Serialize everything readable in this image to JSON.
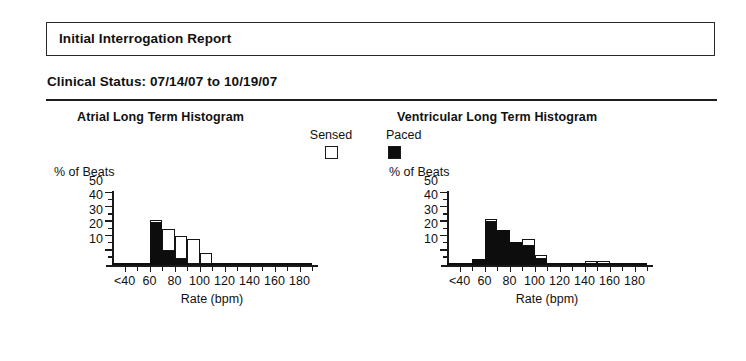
{
  "report": {
    "title": "Initial Interrogation Report",
    "clinical_status": "Clinical Status: 07/14/07 to 10/19/07"
  },
  "legend": {
    "sensed_label": "Sensed",
    "sensed_swatch": "open-square",
    "paced_label": "Paced",
    "paced_swatch": "filled-square"
  },
  "panels": {
    "atrial": {
      "title": "Atrial Long Term Histogram"
    },
    "ventricular": {
      "title": "Ventricular Long Term Histogram"
    }
  },
  "axes": {
    "ylabel": "% of Beats",
    "xlabel": "Rate (bpm)",
    "yticks": [
      "10",
      "20",
      "30",
      "40",
      "50"
    ],
    "xticks": [
      "<40",
      "60",
      "80",
      "100",
      "120",
      "140",
      "160",
      "180"
    ]
  },
  "colors": {
    "ink": "#141414",
    "paced": "#0d0d0d",
    "sensed": "#ffffff",
    "paper": "#ffffff"
  },
  "chart_data": [
    {
      "type": "bar",
      "id": "atrial-long-term-histogram",
      "title": "Atrial Long Term Histogram",
      "xlabel": "Rate (bpm)",
      "ylabel": "% of Beats",
      "ylim": [
        0,
        50
      ],
      "yticks": [
        10,
        20,
        30,
        40,
        50
      ],
      "xtick_labels": [
        "<40",
        "60",
        "80",
        "100",
        "120",
        "140",
        "160",
        "180"
      ],
      "xtick_values": [
        40,
        60,
        80,
        100,
        120,
        140,
        160,
        180
      ],
      "bin_width": 10,
      "grid": false,
      "legend_position": "top-center",
      "stacked": true,
      "categories": [
        "<40",
        "40-50",
        "50-60",
        "60-70",
        "70-80",
        "80-90",
        "90-100",
        "100-110",
        "110-120",
        "120-130",
        "130-140",
        "140-150",
        "150-160",
        "160-170",
        "170-180",
        "180+"
      ],
      "bin_starts": [
        30,
        40,
        50,
        60,
        70,
        80,
        90,
        100,
        110,
        120,
        130,
        140,
        150,
        160,
        170,
        180
      ],
      "series": [
        {
          "name": "Paced",
          "values": [
            1,
            1,
            1,
            29,
            10,
            4,
            1,
            1,
            1,
            1,
            1,
            1,
            1,
            1,
            1,
            1
          ]
        },
        {
          "name": "Sensed",
          "values": [
            0,
            0,
            0,
            2,
            15,
            16,
            17,
            7,
            0,
            0,
            0,
            0,
            0,
            0,
            0,
            0
          ]
        }
      ],
      "totals": [
        1,
        1,
        1,
        31,
        25,
        20,
        18,
        8,
        1,
        1,
        1,
        1,
        1,
        1,
        1,
        1
      ]
    },
    {
      "type": "bar",
      "id": "ventricular-long-term-histogram",
      "title": "Ventricular Long Term Histogram",
      "xlabel": "Rate (bpm)",
      "ylabel": "% of Beats",
      "ylim": [
        0,
        50
      ],
      "yticks": [
        10,
        20,
        30,
        40,
        50
      ],
      "xtick_labels": [
        "<40",
        "60",
        "80",
        "100",
        "120",
        "140",
        "160",
        "180"
      ],
      "xtick_values": [
        40,
        60,
        80,
        100,
        120,
        140,
        160,
        180
      ],
      "bin_width": 10,
      "grid": false,
      "legend_position": "top-center",
      "stacked": true,
      "categories": [
        "<40",
        "40-50",
        "50-60",
        "60-70",
        "70-80",
        "80-90",
        "90-100",
        "100-110",
        "110-120",
        "120-130",
        "130-140",
        "140-150",
        "150-160",
        "160-170",
        "170-180",
        "180+"
      ],
      "bin_starts": [
        30,
        40,
        50,
        60,
        70,
        80,
        90,
        100,
        110,
        120,
        130,
        140,
        150,
        160,
        170,
        180
      ],
      "series": [
        {
          "name": "Paced",
          "values": [
            1,
            1,
            4,
            30,
            24,
            16,
            13,
            4,
            1,
            1,
            1,
            1,
            1,
            1,
            1,
            1
          ]
        },
        {
          "name": "Sensed",
          "values": [
            0,
            0,
            0,
            2,
            0,
            0,
            5,
            3,
            0,
            0,
            0,
            2,
            2,
            0,
            0,
            0
          ]
        }
      ],
      "totals": [
        1,
        1,
        4,
        32,
        24,
        16,
        18,
        7,
        1,
        1,
        1,
        3,
        3,
        1,
        1,
        1
      ]
    }
  ]
}
